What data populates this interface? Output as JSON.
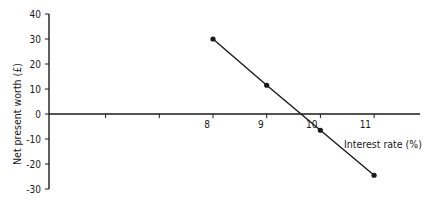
{
  "chart_data": {
    "type": "line",
    "title": "",
    "xlabel": "Interest rate (%)",
    "ylabel": "Net present worth (£)",
    "x": [
      8,
      9,
      10,
      11
    ],
    "series": [
      {
        "name": "Net present worth",
        "values": [
          30,
          11.5,
          -6.5,
          -24.5
        ]
      }
    ],
    "xticks": [
      6,
      7,
      8,
      9,
      10,
      11
    ],
    "xtick_labels": [
      "",
      "",
      "8",
      "9",
      "10",
      "11"
    ],
    "yticks": [
      40,
      30,
      20,
      10,
      0,
      -10,
      -20,
      -30
    ],
    "ytick_labels": [
      "40",
      "30",
      "20",
      "10",
      "0",
      "-10",
      "-20",
      "-30"
    ],
    "ylim": [
      -30,
      40
    ],
    "grid": false,
    "legend": "none"
  },
  "colors": {
    "line": "#1a1a1a",
    "axis": "#1a1a1a",
    "background": "#ffffff"
  }
}
